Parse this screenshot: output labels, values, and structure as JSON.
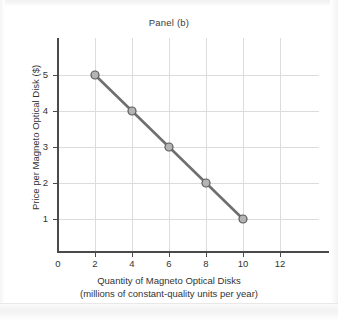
{
  "chart_data": {
    "type": "line",
    "title": "Panel (b)",
    "xlabel_line1": "Quantity of Magneto Optical Disks",
    "xlabel_line2": "(millions of constant-quality units per year)",
    "ylabel": "Price per Magneto Optical Disk ($)",
    "x": [
      2,
      4,
      6,
      8,
      10
    ],
    "values": [
      5,
      4,
      3,
      2,
      1
    ],
    "series": [
      {
        "name": "Demand",
        "points": [
          {
            "x": 2,
            "y": 5
          },
          {
            "x": 4,
            "y": 4
          },
          {
            "x": 6,
            "y": 3
          },
          {
            "x": 8,
            "y": 2
          },
          {
            "x": 10,
            "y": 1
          }
        ]
      }
    ],
    "xticks": [
      "0",
      "2",
      "4",
      "6",
      "8",
      "10",
      "12"
    ],
    "yticks": [
      "5",
      "4",
      "3",
      "2",
      "1"
    ],
    "xlim": [
      0,
      14
    ],
    "ylim": [
      0,
      6
    ],
    "grid": true,
    "legend": "none",
    "line_color": "#6f6f6f",
    "marker_fill": "#b4b4b4",
    "marker_edge": "#5a5a5a",
    "grid_color": "#dcdcdc",
    "axis_color": "#4a4a4a",
    "background": "#ffffff"
  },
  "axes": {
    "x_tick_positions_px": [
      58,
      95,
      132,
      169,
      206,
      243,
      280
    ],
    "y_tick_positions_px": [
      75,
      111,
      147,
      183,
      219
    ],
    "origin_label": "0"
  }
}
